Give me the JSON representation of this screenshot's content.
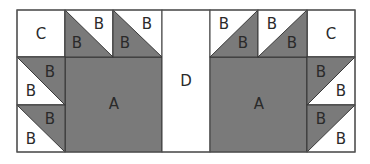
{
  "colors": {
    "dark": "#7a7a7a",
    "light": "#ffffff",
    "line": "#3a3a3a",
    "outer": "#555555"
  },
  "labels": {
    "A": "A",
    "B": "B",
    "C": "C",
    "D": "D"
  },
  "pieces": {
    "left_c": "C",
    "left_a": "A",
    "center_d": "D",
    "right_a": "A",
    "right_c": "C",
    "left_top_b1_dark": "B",
    "left_top_b1_light": "B",
    "left_top_b2_dark": "B",
    "left_top_b2_light": "B",
    "left_side_b1_dark": "B",
    "left_side_b1_light": "B",
    "left_side_b2_dark": "B",
    "left_side_b2_light": "B",
    "right_top_b1_light": "B",
    "right_top_b1_dark": "B",
    "right_top_b2_light": "B",
    "right_top_b2_dark": "B",
    "right_side_b1_dark": "B",
    "right_side_b1_light": "B",
    "right_side_b2_dark": "B",
    "right_side_b2_light": "B"
  }
}
